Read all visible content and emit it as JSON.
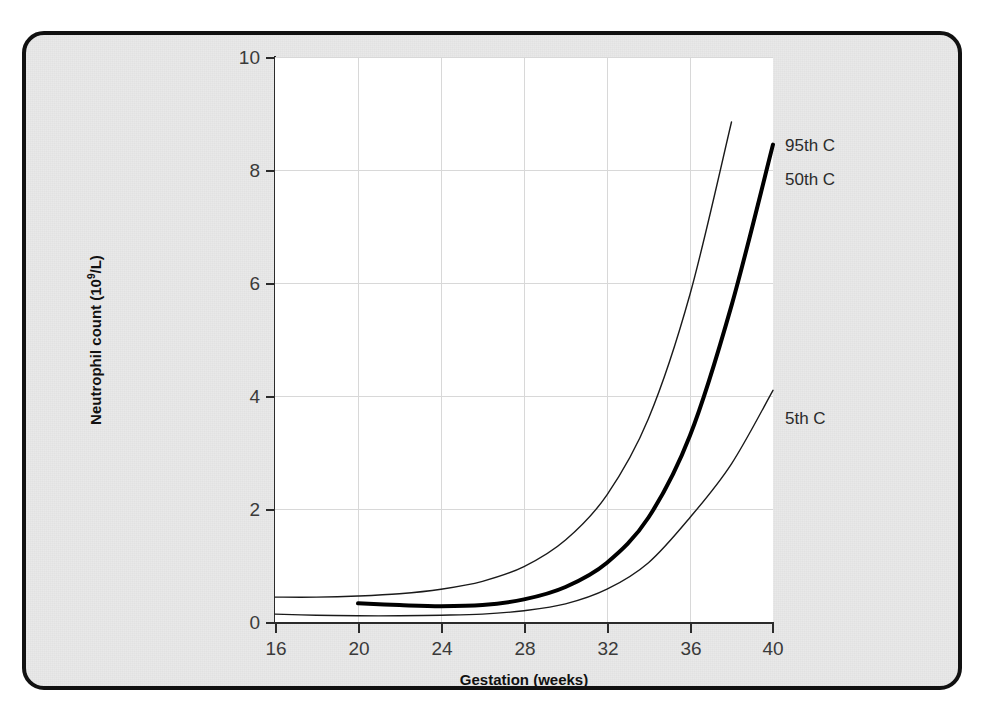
{
  "figure": {
    "cutoff_text_above": "",
    "panel_border_color": "#111111",
    "panel_background_color": "#e9e9e9",
    "plot_background_color": "#ffffff"
  },
  "chart_data": {
    "type": "line",
    "title": "",
    "xlabel": "Gestation (weeks)",
    "ylabel": "Neutrophil count (10⁹/L)",
    "ylabel_base": "Neutrophil count (10",
    "ylabel_sup": "9",
    "ylabel_tail": "/L)",
    "xlim": [
      16,
      40
    ],
    "ylim": [
      0,
      10
    ],
    "xticks": [
      16,
      20,
      24,
      28,
      32,
      36,
      40
    ],
    "yticks": [
      0,
      2,
      4,
      6,
      8,
      10
    ],
    "xtick_labels": [
      "16",
      "20",
      "24",
      "28",
      "32",
      "36",
      "40"
    ],
    "ytick_labels": [
      "0",
      "2",
      "4",
      "6",
      "8",
      "10"
    ],
    "grid": true,
    "grid_color": "#d8d8d8",
    "legend_position": "right-inline-annotations",
    "series": [
      {
        "name": "95th C",
        "label": "95th C",
        "color": "#1a1a1a",
        "line_width": 1.4,
        "x": [
          16,
          18,
          20,
          22,
          24,
          26,
          28,
          30,
          32,
          34,
          36,
          38
        ],
        "values": [
          0.44,
          0.44,
          0.46,
          0.5,
          0.58,
          0.72,
          0.98,
          1.45,
          2.25,
          3.6,
          5.8,
          8.85
        ]
      },
      {
        "name": "50th C",
        "label": "50th C",
        "color": "#000000",
        "line_width": 4.0,
        "x": [
          20,
          22,
          24,
          26,
          28,
          30,
          32,
          34,
          36,
          38,
          40
        ],
        "values": [
          0.33,
          0.3,
          0.28,
          0.3,
          0.4,
          0.62,
          1.05,
          1.85,
          3.3,
          5.6,
          8.45
        ]
      },
      {
        "name": "5th C",
        "label": "5th C",
        "color": "#1a1a1a",
        "line_width": 1.4,
        "x": [
          16,
          18,
          20,
          22,
          24,
          26,
          28,
          30,
          32,
          34,
          36,
          38,
          40
        ],
        "values": [
          0.14,
          0.12,
          0.11,
          0.11,
          0.12,
          0.14,
          0.2,
          0.32,
          0.58,
          1.05,
          1.85,
          2.8,
          4.1
        ]
      }
    ],
    "annotations": [
      {
        "text": "95th C",
        "x_px": 785,
        "y_px": 112
      },
      {
        "text": "50th C",
        "x_px": 785,
        "y_px": 146
      },
      {
        "text": "5th C",
        "x_px": 785,
        "y_px": 385
      }
    ]
  }
}
